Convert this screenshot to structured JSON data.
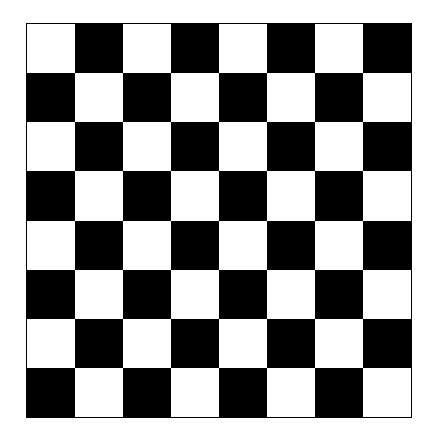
{
  "board": {
    "rows": 8,
    "cols": 8,
    "top_left": "light",
    "colors": {
      "light": "#ffffff",
      "dark": "#000000",
      "border": "#000000"
    }
  }
}
